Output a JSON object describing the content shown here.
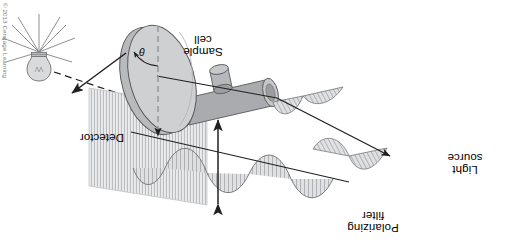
{
  "figure": {
    "orientation_degrees": 180,
    "background_color": "#ffffff"
  },
  "copyright": {
    "text": "© 2013 Cengage Learning"
  },
  "labels": {
    "detector": "Detector",
    "sample_cell_line1": "Sample",
    "sample_cell_line2": "cell",
    "polarizing_filter_line1": "Polarizing",
    "polarizing_filter_line2": "filter",
    "light_source_line1": "Light",
    "light_source_line2": "source",
    "angle_symbol": "θ"
  },
  "icons": {
    "light_bulb": "light-bulb-icon",
    "polarizing_filter_plane": "polarizing-filter-icon",
    "sample_cell_cylinder": "sample-cell-icon",
    "detector_disk": "detector-disk-icon",
    "rotation_arrow": "rotation-arrow-icon",
    "reference_axis_arrow": "dashed-reference-axis-icon",
    "polarization_double_arrow": "polarization-double-arrow-icon",
    "incident_ray": "incident-ray-icon",
    "polarized_wave": "polarized-wave-icon",
    "rotated_wave": "rotated-wave-icon"
  },
  "colors": {
    "stroke": "#231f20",
    "dark_gray": "#808285",
    "mid_gray": "#a7a9ac",
    "light_gray": "#c7c8ca",
    "pale_gray": "#d9dadb",
    "filter_fill": "#d2d3d5",
    "copyright_text": "#777777"
  }
}
